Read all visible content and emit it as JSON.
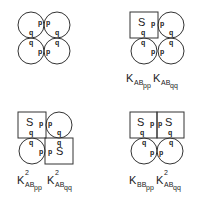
{
  "panels": [
    {
      "id": "panel-1",
      "cells": [
        {
          "shape": "circle",
          "sites": [
            "p",
            "q"
          ]
        },
        {
          "shape": "circle",
          "sites": [
            "p",
            "q"
          ]
        },
        {
          "shape": "circle",
          "sites": [
            "q",
            "p"
          ]
        },
        {
          "shape": "circle",
          "sites": [
            "q",
            "p"
          ]
        }
      ],
      "label": null
    },
    {
      "id": "panel-2",
      "cells": [
        {
          "shape": "square",
          "text": "S",
          "sites": [
            "p",
            "q"
          ]
        },
        {
          "shape": "circle",
          "sites": [
            "p",
            "q"
          ]
        },
        {
          "shape": "circle",
          "sites": [
            "q",
            "p"
          ]
        },
        {
          "shape": "circle",
          "sites": [
            "q",
            "p"
          ]
        }
      ],
      "label": {
        "terms": [
          {
            "base": "K",
            "sub": "AB",
            "subsub": "pp",
            "sup": ""
          },
          {
            "base": "K",
            "sub": "AB",
            "subsub": "qq",
            "sup": ""
          }
        ]
      }
    },
    {
      "id": "panel-3",
      "cells": [
        {
          "shape": "square",
          "text": "S",
          "sites": [
            "p",
            "q"
          ]
        },
        {
          "shape": "circle",
          "sites": [
            "p",
            "q"
          ]
        },
        {
          "shape": "circle",
          "sites": [
            "q",
            "p"
          ]
        },
        {
          "shape": "square",
          "text": "S",
          "sites": [
            "q",
            "p"
          ]
        }
      ],
      "label": {
        "terms": [
          {
            "base": "K",
            "sub": "AB",
            "subsub": "pp",
            "sup": "2"
          },
          {
            "base": "K",
            "sub": "AB",
            "subsub": "qq",
            "sup": "2"
          }
        ]
      }
    },
    {
      "id": "panel-4",
      "cells": [
        {
          "shape": "square",
          "text": "S",
          "sites": [
            "p",
            "q"
          ]
        },
        {
          "shape": "square",
          "text": "S",
          "sites": [
            "p",
            "q"
          ]
        },
        {
          "shape": "circle",
          "sites": [
            "q",
            "p"
          ]
        },
        {
          "shape": "circle",
          "sites": [
            "q",
            "p"
          ]
        }
      ],
      "label": {
        "terms": [
          {
            "base": "K",
            "sub": "BB",
            "subsub": "pp",
            "sup": ""
          },
          {
            "base": "K",
            "sub": "AB",
            "subsub": "qq",
            "sup": "2"
          }
        ]
      }
    }
  ],
  "text": {
    "p": "p",
    "q": "q",
    "S": "S",
    "K": "K",
    "two": "2",
    "AB": "AB",
    "BB": "BB",
    "pp": "pp",
    "qq": "qq"
  }
}
